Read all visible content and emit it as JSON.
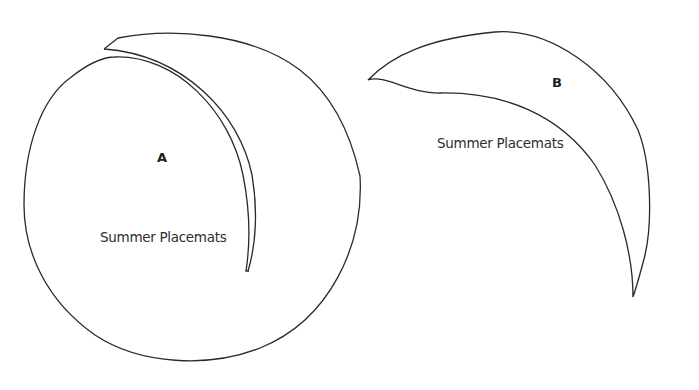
{
  "shapes": [
    {
      "id": "A",
      "letter": "A",
      "caption": "Summer Placemats"
    },
    {
      "id": "B",
      "letter": "B",
      "caption": "Summer Placemats"
    }
  ],
  "colors": {
    "background": "#ffffff",
    "stroke": "#2a2a2a",
    "text": "#2e2e2e"
  }
}
